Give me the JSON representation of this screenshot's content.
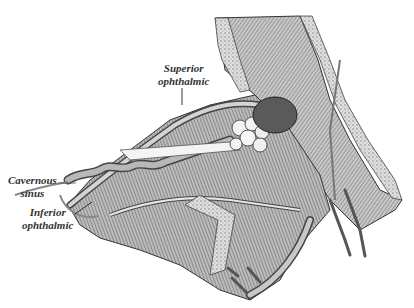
{
  "figure": {
    "labels": [
      {
        "id": "superior",
        "lines": [
          "Superior",
          "ophthalmic"
        ]
      },
      {
        "id": "cavernous",
        "lines": [
          "Cavernous",
          "sinus"
        ]
      },
      {
        "id": "inferior",
        "lines": [
          "Inferior",
          "ophthalmic"
        ]
      }
    ],
    "colors": {
      "ink": "#333333",
      "mid": "#8a8a8a",
      "light": "#d8d8d8",
      "background": "#ffffff"
    }
  }
}
